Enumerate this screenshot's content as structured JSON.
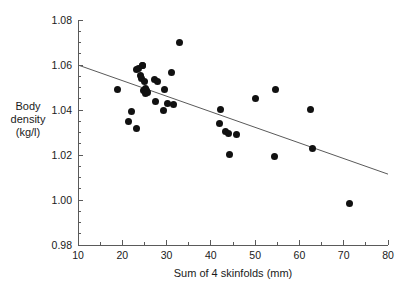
{
  "chart_data": {
    "type": "scatter",
    "title": "",
    "xlabel": "Sum of 4 skinfolds (mm)",
    "ylabel_lines": [
      "Body",
      "density",
      "(kg/l)"
    ],
    "ylabel": "Body density (kg/l)",
    "xlim": [
      10,
      80
    ],
    "ylim": [
      0.98,
      1.08
    ],
    "xticks": [
      10,
      20,
      30,
      40,
      50,
      60,
      70,
      80
    ],
    "xtick_labels": [
      "10",
      "20",
      "30",
      "40",
      "50",
      "60",
      "70",
      "80"
    ],
    "xminor_tick_step": 5,
    "yticks": [
      0.98,
      1.0,
      1.02,
      1.04,
      1.06,
      1.08
    ],
    "ytick_labels": [
      "0.98",
      "1.00",
      "1.02",
      "1.04",
      "1.06",
      "1.08"
    ],
    "yminor_tick_step": 0.005,
    "grid": false,
    "legend": null,
    "marker": {
      "shape": "circle",
      "filled": true,
      "color": "#111111",
      "size_px": 7
    },
    "x": [
      19.0,
      21.5,
      22.0,
      23.2,
      23.3,
      23.6,
      24.0,
      24.3,
      24.5,
      24.6,
      24.8,
      25.0,
      25.2,
      25.3,
      25.4,
      25.6,
      27.3,
      27.6,
      28.0,
      29.3,
      29.6,
      30.2,
      31.2,
      31.6,
      32.9,
      41.9,
      42.1,
      43.3,
      44.0,
      44.1,
      45.7,
      50.0,
      54.4,
      54.5,
      62.4,
      63.0,
      71.4
    ],
    "y": [
      1.049,
      1.035,
      1.0395,
      1.032,
      1.058,
      1.0585,
      1.0555,
      1.054,
      1.06,
      1.06,
      1.0485,
      1.0525,
      1.0495,
      1.0475,
      1.0485,
      1.048,
      1.0535,
      1.044,
      1.0525,
      1.04,
      1.049,
      1.043,
      1.0565,
      1.0425,
      1.07,
      1.034,
      1.0401,
      1.0305,
      1.0295,
      1.0202,
      1.029,
      1.045,
      1.0192,
      1.0492,
      1.0403,
      1.023,
      0.9985
    ],
    "trend_line": {
      "type": "linear-fit",
      "x_start": 10,
      "y_start": 1.06,
      "x_end": 80,
      "y_end": 1.0115,
      "color": "#5a5a5a",
      "width_px": 1
    },
    "n_points": 37,
    "axis_color": "#5a5a5a",
    "background": "#ffffff"
  }
}
